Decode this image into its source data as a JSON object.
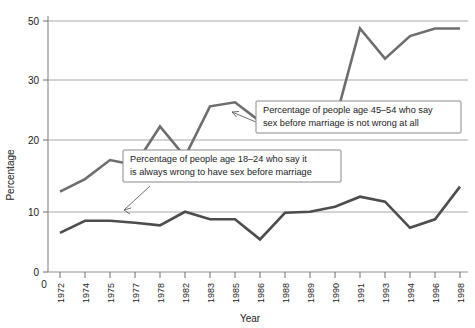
{
  "chart_data": {
    "type": "line",
    "title": "",
    "xlabel": "Year",
    "ylabel": "Percentage",
    "xlim": [
      0,
      16
    ],
    "ylim": [
      0,
      52
    ],
    "grid": "horizontal",
    "legend_position": "none",
    "categories": [
      "1972",
      "1974",
      "1975",
      "1977",
      "1978",
      "1982",
      "1983",
      "1985",
      "1986",
      "1988",
      "1989",
      "1990",
      "1991",
      "1993",
      "1994",
      "1996",
      "1998"
    ],
    "ytick_labels": [
      "0",
      "10",
      "20",
      "30",
      "50"
    ],
    "ytick_values": [
      0,
      10,
      20,
      30,
      50
    ],
    "origin_label": "0",
    "series": [
      {
        "name": "Percentage of people age 45-54 who say sex before marriage is not wrong at all",
        "color": "#6e6e6e",
        "values": [
          16,
          18.5,
          22.3,
          21.3,
          29,
          23,
          33,
          33.8,
          30,
          32.5,
          32,
          30,
          48.5,
          42.5,
          47,
          48.5,
          48.5
        ]
      },
      {
        "name": "Percentage of people age 18-24 who say it is always wrong to have sex before marriage",
        "color": "#4d4d4d",
        "values": [
          7.8,
          10.2,
          10.2,
          9.8,
          9.3,
          12,
          10.5,
          10.5,
          6.5,
          11.8,
          12,
          13,
          15,
          14,
          8.8,
          10.5,
          17
        ]
      }
    ],
    "annotations": [
      {
        "id": "annotation-45-54",
        "line1": "Percentage of people age 45–54 who say",
        "line2": "sex before marriage is not wrong at all"
      },
      {
        "id": "annotation-18-24",
        "line1": "Percentage of people age 18–24 who say it",
        "line2": "is always wrong to have sex before marriage"
      }
    ]
  },
  "axes": {
    "y_title": "Percentage",
    "x_title": "Year"
  }
}
